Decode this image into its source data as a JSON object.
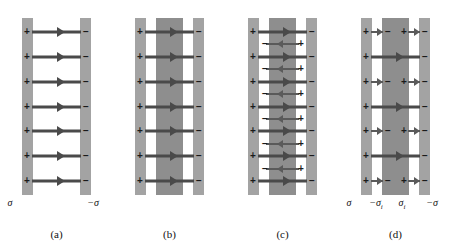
{
  "figure": {
    "panel_count": 4,
    "colors": {
      "plate_gray": "#a3a3a3",
      "dielectric_gray": "#8e8e8e",
      "arrow_gray": "#4a4a4a",
      "bound_arrow_gray": "#5a5a5a",
      "background": "#ffffff",
      "text": "#111111"
    },
    "symbols": {
      "plus": "+",
      "minus": "−",
      "sigma": "σ",
      "neg_sigma": "−σ",
      "sigma_i": "σ",
      "neg_sigma_i": "−σ",
      "subscript_i": "i"
    }
  },
  "panels": [
    {
      "id": "a",
      "caption": "(a)",
      "description": "Empty parallel-plate capacitor: uniform field lines from positive to negative plate",
      "has_dielectric": false,
      "field_line_count": 7,
      "left_plate_sign": "+",
      "right_plate_sign": "−",
      "labels": [
        {
          "text": "σ",
          "sub": "",
          "x_pct": 9
        },
        {
          "text": "−σ",
          "sub": "",
          "x_pct": 82
        }
      ]
    },
    {
      "id": "b",
      "caption": "(b)",
      "description": "Dielectric slab inserted between the plates; applied field lines still cross the gap",
      "has_dielectric": true,
      "field_line_count": 7,
      "left_plate_sign": "+",
      "right_plate_sign": "−",
      "labels": []
    },
    {
      "id": "c",
      "caption": "(c)",
      "description": "Induced polarization field inside dielectric shown as short reversed arrows between the applied field lines",
      "has_dielectric": true,
      "field_line_count": 7,
      "induced_line_count": 6,
      "induced_left_sign": "−",
      "induced_right_sign": "+",
      "left_plate_sign": "+",
      "right_plate_sign": "−",
      "labels": []
    },
    {
      "id": "d",
      "caption": "(d)",
      "description": "Net field: reduced field inside dielectric with bound surface charges on slab faces",
      "has_dielectric": true,
      "field_line_count": 7,
      "left_plate_sign": "+",
      "right_plate_sign": "−",
      "slab_left_sign": "−",
      "slab_right_sign": "+",
      "labels": [
        {
          "text": "σ",
          "sub": "",
          "x_pct": 9
        },
        {
          "text": "−σ",
          "sub": "i",
          "x_pct": 33
        },
        {
          "text": "σ",
          "sub": "i",
          "x_pct": 56
        },
        {
          "text": "−σ",
          "sub": "",
          "x_pct": 82
        }
      ]
    }
  ]
}
